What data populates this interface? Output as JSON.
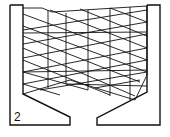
{
  "figure": {
    "label": "2",
    "stroke_color": "#111111",
    "background": "#ffffff"
  },
  "frame": {
    "left_post": "10,5 23,5 23,94 70,117 70,125 10,125 10,5",
    "right_post": "147,5 160,5 160,125 97,125 97,118 147,92 147,5"
  },
  "mesh": {
    "outline": "23,8 42,8 52,12 147,6 147,75 135,100 70,80 23,94",
    "verticals": [
      [
        48,
        10,
        48,
        88
      ],
      [
        66,
        13,
        66,
        84
      ],
      [
        88,
        10,
        88,
        90
      ],
      [
        110,
        8,
        110,
        96
      ],
      [
        130,
        7,
        130,
        100
      ]
    ],
    "diag_down": [
      [
        23,
        14,
        147,
        60
      ],
      [
        23,
        26,
        147,
        72
      ],
      [
        23,
        36,
        140,
        82
      ],
      [
        23,
        48,
        135,
        96
      ],
      [
        23,
        60,
        110,
        95
      ],
      [
        23,
        72,
        88,
        90
      ],
      [
        23,
        84,
        60,
        95
      ],
      [
        50,
        10,
        147,
        48
      ],
      [
        80,
        9,
        147,
        36
      ],
      [
        110,
        8,
        147,
        22
      ]
    ],
    "diag_up": [
      [
        23,
        30,
        147,
        10
      ],
      [
        23,
        44,
        147,
        22
      ],
      [
        23,
        58,
        147,
        34
      ],
      [
        23,
        72,
        147,
        48
      ],
      [
        23,
        84,
        147,
        60
      ],
      [
        40,
        90,
        147,
        72
      ],
      [
        66,
        84,
        147,
        86
      ],
      [
        95,
        88,
        140,
        80
      ]
    ],
    "horizontals": [
      [
        23,
        33,
        147,
        32
      ],
      [
        23,
        72,
        147,
        70
      ]
    ]
  }
}
